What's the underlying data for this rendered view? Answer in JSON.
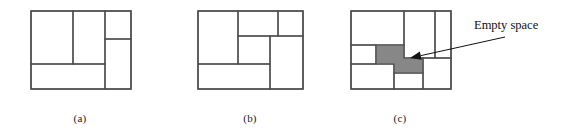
{
  "figure": {
    "background_color": "#ffffff",
    "line_color": "#4a4a4a",
    "shade_color": "#878787",
    "text_color": "#111111",
    "panels": [
      {
        "id": "a",
        "caption": "(a)",
        "frame": {
          "x": 0,
          "y": 0,
          "width": 100,
          "height": 78
        },
        "rects": [
          {
            "name": "block-a-1",
            "x": 0,
            "y": 0,
            "width": 42,
            "height": 53,
            "filled": false
          },
          {
            "name": "block-a-2",
            "x": 42,
            "y": 0,
            "width": 32,
            "height": 53,
            "filled": false
          },
          {
            "name": "block-a-3",
            "x": 74,
            "y": 0,
            "width": 26,
            "height": 28,
            "filled": false
          },
          {
            "name": "block-a-4",
            "x": 74,
            "y": 28,
            "width": 26,
            "height": 50,
            "filled": false
          },
          {
            "name": "block-a-5",
            "x": 0,
            "y": 53,
            "width": 74,
            "height": 25,
            "filled": false
          }
        ]
      },
      {
        "id": "b",
        "caption": "(b)",
        "frame": {
          "x": 0,
          "y": 0,
          "width": 105,
          "height": 78
        },
        "rects": [
          {
            "name": "block-b-1",
            "x": 0,
            "y": 0,
            "width": 40,
            "height": 53,
            "filled": false
          },
          {
            "name": "block-b-2",
            "x": 40,
            "y": 0,
            "width": 40,
            "height": 25,
            "filled": false
          },
          {
            "name": "block-b-3",
            "x": 80,
            "y": 0,
            "width": 25,
            "height": 25,
            "filled": false
          },
          {
            "name": "block-b-4",
            "x": 40,
            "y": 25,
            "width": 32,
            "height": 28,
            "filled": false
          },
          {
            "name": "block-b-5",
            "x": 72,
            "y": 25,
            "width": 33,
            "height": 53,
            "filled": false
          },
          {
            "name": "block-b-6",
            "x": 0,
            "y": 53,
            "width": 72,
            "height": 25,
            "filled": false
          }
        ]
      },
      {
        "id": "c",
        "caption": "(c)",
        "frame": {
          "x": 0,
          "y": 0,
          "width": 100,
          "height": 78
        },
        "rects": [
          {
            "name": "block-c-1",
            "x": 0,
            "y": 0,
            "width": 53,
            "height": 34,
            "filled": false
          },
          {
            "name": "block-c-2",
            "x": 53,
            "y": 0,
            "width": 31,
            "height": 47,
            "filled": false
          },
          {
            "name": "block-c-3",
            "x": 84,
            "y": 0,
            "width": 16,
            "height": 47,
            "filled": false
          },
          {
            "name": "block-c-4",
            "x": 0,
            "y": 34,
            "width": 25,
            "height": 19,
            "filled": false
          },
          {
            "name": "block-c-5",
            "x": 0,
            "y": 53,
            "width": 43,
            "height": 25,
            "filled": false
          },
          {
            "name": "block-c-6",
            "x": 43,
            "y": 62,
            "width": 29,
            "height": 16,
            "filled": false
          },
          {
            "name": "block-c-7",
            "x": 72,
            "y": 47,
            "width": 28,
            "height": 31,
            "filled": false
          }
        ],
        "empty_space": {
          "name": "empty-space-region",
          "filled": true,
          "points": "25,34 53,34 53,47 72,47 72,62 43,62 43,53 25,53"
        }
      }
    ],
    "annotation": {
      "label": "Empty space",
      "arrow": {
        "name": "empty-space-arrow",
        "tail_x": 505,
        "tail_y": 37,
        "head_x": 410,
        "head_y": 58
      }
    }
  }
}
